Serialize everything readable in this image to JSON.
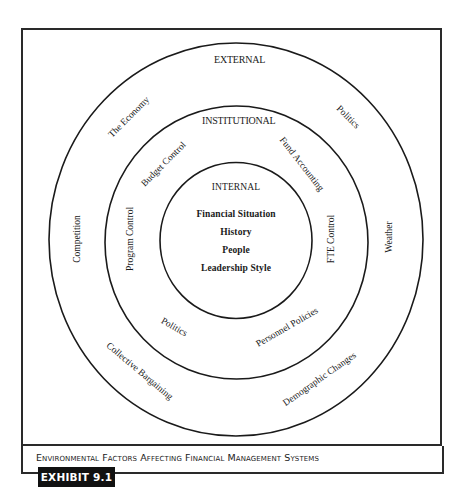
{
  "diagram": {
    "rings": [
      {
        "id": "external",
        "title": "EXTERNAL",
        "factors": [
          "The Economy",
          "Politics",
          "Competition",
          "Weather",
          "Collective Bargaining",
          "Demographic Changes"
        ]
      },
      {
        "id": "institutional",
        "title": "INSTITUTIONAL",
        "factors": [
          "Budget Control",
          "Fund Accounting",
          "Program Control",
          "FTE Control",
          "Politics",
          "Personnel Policies"
        ]
      },
      {
        "id": "internal",
        "title": "INTERNAL",
        "factors": [
          "Financial Situation",
          "History",
          "People",
          "Leadership Style"
        ]
      }
    ]
  },
  "caption": {
    "title": "Environmental Factors Affecting Financial Management Systems",
    "exhibit_label": "EXHIBIT 9.1"
  }
}
